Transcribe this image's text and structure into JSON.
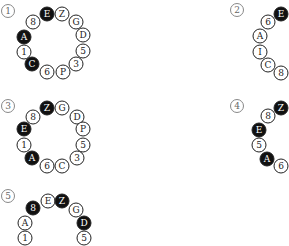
{
  "puzzles": [
    {
      "label": "1",
      "label_pos": [
        8,
        11
      ],
      "beads": [
        {
          "text": "E",
          "black": true,
          "x": 47,
          "y": 14
        },
        {
          "text": "Z",
          "black": false,
          "x": 62,
          "y": 14
        },
        {
          "text": "G",
          "black": false,
          "x": 76,
          "y": 22
        },
        {
          "text": "D",
          "black": false,
          "x": 83,
          "y": 35
        },
        {
          "text": "5",
          "black": false,
          "x": 83,
          "y": 51
        },
        {
          "text": "3",
          "black": false,
          "x": 76,
          "y": 64
        },
        {
          "text": "P",
          "black": false,
          "x": 63,
          "y": 72
        },
        {
          "text": "6",
          "black": false,
          "x": 47,
          "y": 72
        },
        {
          "text": "C",
          "black": true,
          "x": 32,
          "y": 64
        },
        {
          "text": "1",
          "black": false,
          "x": 24,
          "y": 52
        },
        {
          "text": "A",
          "black": true,
          "x": 24,
          "y": 37
        },
        {
          "text": "8",
          "black": false,
          "x": 33,
          "y": 22
        }
      ]
    },
    {
      "label": "2",
      "label_pos": [
        237,
        10
      ],
      "beads": [
        {
          "text": "E",
          "black": true,
          "x": 281,
          "y": 14
        },
        {
          "text": "6",
          "black": false,
          "x": 268,
          "y": 22
        },
        {
          "text": "A",
          "black": false,
          "x": 260,
          "y": 36
        },
        {
          "text": "I",
          "black": false,
          "x": 260,
          "y": 52
        },
        {
          "text": "C",
          "black": false,
          "x": 268,
          "y": 65
        },
        {
          "text": "8",
          "black": false,
          "x": 281,
          "y": 73
        }
      ]
    },
    {
      "label": "3",
      "label_pos": [
        8,
        106
      ],
      "beads": [
        {
          "text": "Z",
          "black": true,
          "x": 47,
          "y": 108
        },
        {
          "text": "G",
          "black": false,
          "x": 62,
          "y": 108
        },
        {
          "text": "D",
          "black": false,
          "x": 77,
          "y": 117
        },
        {
          "text": "P",
          "black": false,
          "x": 83,
          "y": 129
        },
        {
          "text": "5",
          "black": false,
          "x": 83,
          "y": 145
        },
        {
          "text": "3",
          "black": false,
          "x": 77,
          "y": 158
        },
        {
          "text": "C",
          "black": false,
          "x": 62,
          "y": 166
        },
        {
          "text": "6",
          "black": false,
          "x": 47,
          "y": 166
        },
        {
          "text": "A",
          "black": true,
          "x": 32,
          "y": 158
        },
        {
          "text": "1",
          "black": false,
          "x": 24,
          "y": 145
        },
        {
          "text": "E",
          "black": true,
          "x": 24,
          "y": 129
        },
        {
          "text": "8",
          "black": false,
          "x": 33,
          "y": 117
        }
      ]
    },
    {
      "label": "4",
      "label_pos": [
        237,
        106
      ],
      "beads": [
        {
          "text": "Z",
          "black": true,
          "x": 281,
          "y": 108
        },
        {
          "text": "8",
          "black": false,
          "x": 268,
          "y": 116
        },
        {
          "text": "E",
          "black": true,
          "x": 259,
          "y": 130
        },
        {
          "text": "5",
          "black": false,
          "x": 259,
          "y": 145
        },
        {
          "text": "A",
          "black": true,
          "x": 267,
          "y": 159
        },
        {
          "text": "6",
          "black": false,
          "x": 281,
          "y": 166
        }
      ]
    },
    {
      "label": "5",
      "label_pos": [
        8,
        196
      ],
      "beads": [
        {
          "text": "8",
          "black": true,
          "x": 33,
          "y": 208
        },
        {
          "text": "E",
          "black": false,
          "x": 48,
          "y": 201
        },
        {
          "text": "Z",
          "black": true,
          "x": 62,
          "y": 201
        },
        {
          "text": "G",
          "black": false,
          "x": 76,
          "y": 210
        },
        {
          "text": "D",
          "black": true,
          "x": 84,
          "y": 223
        },
        {
          "text": "5",
          "black": false,
          "x": 84,
          "y": 238
        },
        {
          "text": "A",
          "black": false,
          "x": 25,
          "y": 223
        },
        {
          "text": "1",
          "black": false,
          "x": 25,
          "y": 238
        }
      ]
    }
  ]
}
